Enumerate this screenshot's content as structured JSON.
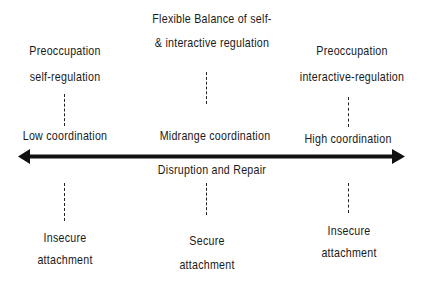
{
  "diagram": {
    "top": {
      "left": {
        "line1": "Preoccupation",
        "line2": "self-regulation"
      },
      "center": {
        "line1": "Flexible Balance of  self-",
        "line2": "& interactive regulation"
      },
      "right": {
        "line1": "Preoccupation",
        "line2": "interactive-regulation"
      }
    },
    "axis": {
      "left_label": "Low coordination",
      "center_label": "Midrange coordination",
      "right_label": "High coordination",
      "below_center_label": "Disruption and Repair",
      "direction": "bidirectional",
      "color": "#111111"
    },
    "bottom": {
      "left": {
        "line1": "Insecure",
        "line2": "attachment"
      },
      "center": {
        "line1": "Secure",
        "line2": "attachment"
      },
      "right": {
        "line1": "Insecure",
        "line2": "attachment"
      }
    }
  }
}
